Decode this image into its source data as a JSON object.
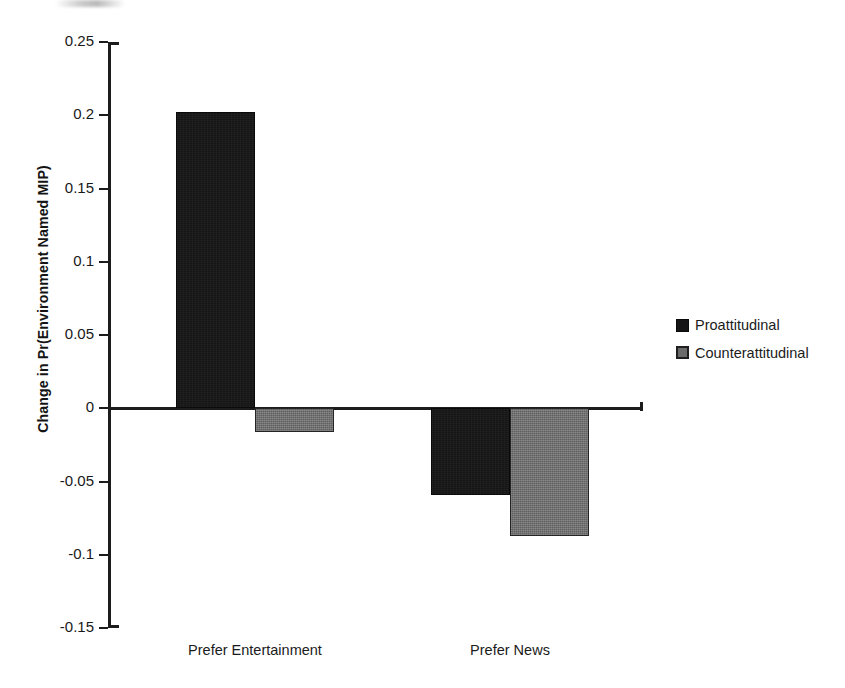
{
  "chart_data": {
    "type": "bar",
    "title": "",
    "subtitle": "",
    "xlabel": "",
    "ylabel": "Change in Pr(Environment Named MIP)",
    "categories": [
      "Prefer Entertainment",
      "Prefer News"
    ],
    "series": [
      {
        "name": "Proattitudinal",
        "color": "#151515",
        "values": [
          0.202,
          -0.059
        ]
      },
      {
        "name": "Counterattitudinal",
        "color": "#6b6b6b",
        "values": [
          -0.016,
          -0.087
        ]
      }
    ],
    "ylim": [
      -0.15,
      0.25
    ],
    "ytick_step": 0.05,
    "ytick_labels": [
      "0.25",
      "0.2",
      "0.15",
      "0.1",
      "0.05",
      "0",
      "-0.05",
      "-0.1",
      "-0.15"
    ],
    "ytick_values": [
      0.25,
      0.2,
      0.15,
      0.1,
      0.05,
      0,
      -0.05,
      -0.1,
      -0.15
    ],
    "grid": false,
    "legend_position": "right",
    "zero_line": true,
    "orientation": "vertical"
  },
  "legend": {
    "items": [
      {
        "label": "Proattitudinal",
        "swatch": "black-square-icon"
      },
      {
        "label": "Counterattitudinal",
        "swatch": "gray-square-icon"
      }
    ]
  },
  "axis": {
    "y_title": "Change in Pr(Environment Named MIP)"
  }
}
